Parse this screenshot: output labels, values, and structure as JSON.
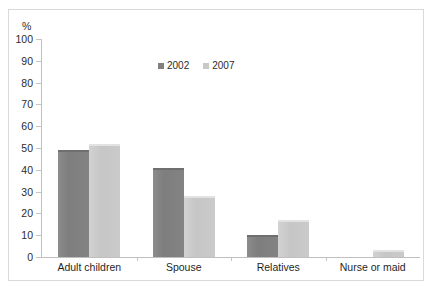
{
  "chart_data": {
    "type": "bar",
    "title": "",
    "subtitle": "",
    "xlabel": "",
    "ylabel": "%",
    "ylim": [
      0,
      100
    ],
    "ytick_step": 10,
    "yticks": [
      "100",
      "90",
      "80",
      "70",
      "60",
      "50",
      "40",
      "30",
      "20",
      "10",
      "0"
    ],
    "grid": false,
    "legend_position": "top-center",
    "categories": [
      "Adult children",
      "Spouse",
      "Relatives",
      "Nurse or maid"
    ],
    "series": [
      {
        "name": "2002",
        "color": "#808080",
        "values": [
          49,
          41,
          10,
          0
        ]
      },
      {
        "name": "2007",
        "color": "#c8c8c8",
        "values": [
          52,
          28,
          17,
          3
        ]
      }
    ]
  },
  "axis": {
    "unit_label": "%"
  },
  "legend": {
    "items": [
      {
        "label": "2002"
      },
      {
        "label": "2007"
      }
    ]
  }
}
